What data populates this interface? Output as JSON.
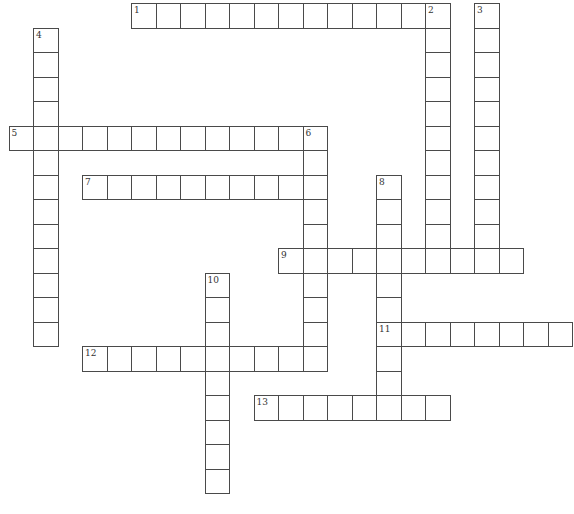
{
  "puzzle": {
    "cell_size": 24.5,
    "origin_x": 8.5,
    "origin_y": 3,
    "border_color": "#4a4a4a",
    "entries": [
      {
        "number": "1",
        "direction": "across",
        "row": 0,
        "col": 5,
        "length": 13
      },
      {
        "number": "2",
        "direction": "down",
        "row": 0,
        "col": 17,
        "length": 11
      },
      {
        "number": "3",
        "direction": "down",
        "row": 0,
        "col": 19,
        "length": 11
      },
      {
        "number": "4",
        "direction": "down",
        "row": 1,
        "col": 1,
        "length": 13
      },
      {
        "number": "5",
        "direction": "across",
        "row": 5,
        "col": 0,
        "length": 13
      },
      {
        "number": "6",
        "direction": "down",
        "row": 5,
        "col": 12,
        "length": 10
      },
      {
        "number": "7",
        "direction": "across",
        "row": 7,
        "col": 3,
        "length": 10
      },
      {
        "number": "8",
        "direction": "down",
        "row": 7,
        "col": 15,
        "length": 10
      },
      {
        "number": "9",
        "direction": "across",
        "row": 10,
        "col": 11,
        "length": 10
      },
      {
        "number": "10",
        "direction": "down",
        "row": 11,
        "col": 8,
        "length": 9
      },
      {
        "number": "11",
        "direction": "across",
        "row": 13,
        "col": 15,
        "length": 8
      },
      {
        "number": "12",
        "direction": "across",
        "row": 14,
        "col": 3,
        "length": 10
      },
      {
        "number": "13",
        "direction": "across",
        "row": 16,
        "col": 10,
        "length": 8
      }
    ]
  }
}
